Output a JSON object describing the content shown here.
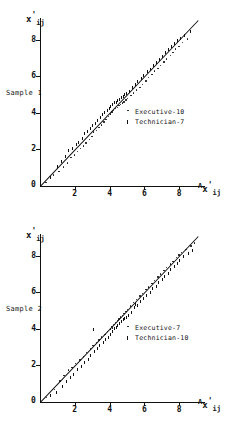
{
  "figure": {
    "background": "#ffffff",
    "ink": "#111111",
    "panel_count": 2
  },
  "chart_data": [
    {
      "type": "scatter",
      "title": "",
      "panel_label": "Sample 1",
      "xlabel": "Ax'ij",
      "ylabel": "x'ij",
      "xlabel_parts": {
        "sup": "A",
        "base": "x",
        "prime": "'",
        "sub": "ij"
      },
      "ylabel_parts": {
        "base": "x",
        "prime": "'",
        "sub": "ij"
      },
      "xlim": [
        0,
        9.2
      ],
      "ylim": [
        0,
        9.2
      ],
      "xticks": [
        2,
        4,
        6,
        8
      ],
      "yticks": [
        2,
        4,
        6,
        8
      ],
      "xticklabels": [
        "2",
        "4",
        "6",
        "8"
      ],
      "yticklabels": [
        "2",
        "4",
        "6",
        "8"
      ],
      "origin_label": "0",
      "grid": false,
      "legend_position": "center-right",
      "legend": [
        {
          "marker": "dot",
          "label": "Executive-10"
        },
        {
          "marker": "tick",
          "label": "Technician-7"
        }
      ],
      "fit_line": {
        "slope": 1.0,
        "intercept": 0.0,
        "style": "solid"
      },
      "points": [
        [
          0.3,
          0.2
        ],
        [
          0.55,
          0.45
        ],
        [
          0.75,
          0.6
        ],
        [
          0.95,
          1.05
        ],
        [
          1.05,
          0.8
        ],
        [
          1.2,
          1.35
        ],
        [
          1.3,
          1.05
        ],
        [
          1.45,
          1.6
        ],
        [
          1.55,
          1.25
        ],
        [
          1.6,
          1.95
        ],
        [
          1.75,
          1.55
        ],
        [
          1.85,
          2.05
        ],
        [
          1.95,
          1.7
        ],
        [
          2.05,
          2.25
        ],
        [
          2.1,
          1.9
        ],
        [
          2.2,
          2.4
        ],
        [
          2.3,
          2.05
        ],
        [
          2.4,
          2.6
        ],
        [
          2.45,
          2.2
        ],
        [
          2.55,
          2.85
        ],
        [
          2.6,
          2.35
        ],
        [
          2.7,
          3.0
        ],
        [
          2.8,
          2.55
        ],
        [
          2.85,
          3.15
        ],
        [
          2.95,
          2.7
        ],
        [
          3.0,
          3.3
        ],
        [
          3.05,
          2.95
        ],
        [
          3.15,
          3.45
        ],
        [
          3.2,
          3.05
        ],
        [
          3.3,
          3.6
        ],
        [
          3.35,
          3.2
        ],
        [
          3.45,
          3.75
        ],
        [
          3.5,
          3.35
        ],
        [
          3.55,
          3.9
        ],
        [
          3.65,
          3.5
        ],
        [
          3.7,
          4.05
        ],
        [
          3.75,
          3.65
        ],
        [
          3.85,
          4.15
        ],
        [
          3.9,
          3.8
        ],
        [
          3.95,
          4.25
        ],
        [
          4.0,
          3.95
        ],
        [
          4.05,
          4.35
        ],
        [
          4.1,
          4.05
        ],
        [
          4.15,
          4.45
        ],
        [
          4.2,
          4.15
        ],
        [
          4.25,
          4.55
        ],
        [
          4.3,
          4.25
        ],
        [
          4.35,
          4.6
        ],
        [
          4.4,
          4.3
        ],
        [
          4.45,
          4.7
        ],
        [
          4.5,
          4.4
        ],
        [
          4.55,
          4.75
        ],
        [
          4.6,
          4.45
        ],
        [
          4.65,
          4.85
        ],
        [
          4.7,
          4.55
        ],
        [
          4.75,
          4.9
        ],
        [
          4.8,
          4.6
        ],
        [
          4.85,
          5.0
        ],
        [
          4.9,
          4.7
        ],
        [
          4.95,
          5.05
        ],
        [
          5.0,
          4.8
        ],
        [
          5.1,
          5.2
        ],
        [
          5.2,
          4.95
        ],
        [
          5.3,
          5.4
        ],
        [
          5.35,
          5.1
        ],
        [
          5.45,
          5.55
        ],
        [
          5.5,
          5.25
        ],
        [
          5.6,
          5.7
        ],
        [
          5.7,
          5.4
        ],
        [
          5.8,
          5.9
        ],
        [
          5.85,
          5.55
        ],
        [
          5.95,
          6.05
        ],
        [
          6.05,
          5.75
        ],
        [
          6.15,
          6.25
        ],
        [
          6.2,
          5.95
        ],
        [
          6.3,
          6.4
        ],
        [
          6.4,
          6.1
        ],
        [
          6.5,
          6.6
        ],
        [
          6.55,
          6.3
        ],
        [
          6.65,
          6.75
        ],
        [
          6.75,
          6.45
        ],
        [
          6.85,
          6.95
        ],
        [
          6.9,
          6.6
        ],
        [
          7.0,
          7.1
        ],
        [
          7.1,
          6.8
        ],
        [
          7.2,
          7.3
        ],
        [
          7.25,
          6.95
        ],
        [
          7.35,
          7.45
        ],
        [
          7.45,
          7.15
        ],
        [
          7.55,
          7.65
        ],
        [
          7.6,
          7.3
        ],
        [
          7.7,
          7.8
        ],
        [
          7.75,
          7.5
        ],
        [
          7.85,
          7.95
        ],
        [
          7.95,
          7.65
        ],
        [
          8.05,
          8.1
        ],
        [
          8.15,
          7.85
        ],
        [
          8.3,
          8.25
        ],
        [
          8.45,
          8.05
        ],
        [
          8.6,
          8.45
        ]
      ]
    },
    {
      "type": "scatter",
      "title": "",
      "panel_label": "Sample 2",
      "xlabel": "Ax'ij",
      "ylabel": "x'ij",
      "xlabel_parts": {
        "sup": "A",
        "base": "x",
        "prime": "'",
        "sub": "ij"
      },
      "ylabel_parts": {
        "base": "x",
        "prime": "'",
        "sub": "ij"
      },
      "xlim": [
        0,
        9.2
      ],
      "ylim": [
        0,
        9.2
      ],
      "xticks": [
        2,
        4,
        6,
        8
      ],
      "yticks": [
        2,
        4,
        6,
        8
      ],
      "xticklabels": [
        "2",
        "4",
        "6",
        "8"
      ],
      "yticklabels": [
        "2",
        "4",
        "6",
        "8"
      ],
      "origin_label": "0",
      "grid": false,
      "legend_position": "center-right",
      "legend": [
        {
          "marker": "dot",
          "label": "Executive-7"
        },
        {
          "marker": "tick",
          "label": "Technician-10"
        }
      ],
      "fit_line": {
        "slope": 1.0,
        "intercept": 0.0,
        "style": "solid"
      },
      "points": [
        [
          0.35,
          0.25
        ],
        [
          0.6,
          0.35
        ],
        [
          0.8,
          0.7
        ],
        [
          0.9,
          0.5
        ],
        [
          1.1,
          1.15
        ],
        [
          1.25,
          0.85
        ],
        [
          1.35,
          1.45
        ],
        [
          1.5,
          1.1
        ],
        [
          1.6,
          1.75
        ],
        [
          1.7,
          1.35
        ],
        [
          1.8,
          1.9
        ],
        [
          1.9,
          1.5
        ],
        [
          2.0,
          2.1
        ],
        [
          2.15,
          1.8
        ],
        [
          2.25,
          2.3
        ],
        [
          2.35,
          1.95
        ],
        [
          2.45,
          2.5
        ],
        [
          2.55,
          2.15
        ],
        [
          2.65,
          2.7
        ],
        [
          2.75,
          2.35
        ],
        [
          2.85,
          2.9
        ],
        [
          2.9,
          2.55
        ],
        [
          3.0,
          3.1
        ],
        [
          3.1,
          2.75
        ],
        [
          3.2,
          3.25
        ],
        [
          3.25,
          2.95
        ],
        [
          3.35,
          3.4
        ],
        [
          3.4,
          3.1
        ],
        [
          3.5,
          3.55
        ],
        [
          3.6,
          3.25
        ],
        [
          3.7,
          3.7
        ],
        [
          3.75,
          3.4
        ],
        [
          3.85,
          3.85
        ],
        [
          3.9,
          3.55
        ],
        [
          4.0,
          4.0
        ],
        [
          4.05,
          3.7
        ],
        [
          4.1,
          4.15
        ],
        [
          4.15,
          3.85
        ],
        [
          4.2,
          4.25
        ],
        [
          4.25,
          4.0
        ],
        [
          4.3,
          4.35
        ],
        [
          4.35,
          4.1
        ],
        [
          4.4,
          4.45
        ],
        [
          4.45,
          4.2
        ],
        [
          4.5,
          4.55
        ],
        [
          4.55,
          4.3
        ],
        [
          4.6,
          4.65
        ],
        [
          4.65,
          4.4
        ],
        [
          4.7,
          4.75
        ],
        [
          4.75,
          4.5
        ],
        [
          4.8,
          4.85
        ],
        [
          4.85,
          4.55
        ],
        [
          4.9,
          4.95
        ],
        [
          4.95,
          4.65
        ],
        [
          5.0,
          5.05
        ],
        [
          5.05,
          4.75
        ],
        [
          5.15,
          5.25
        ],
        [
          5.25,
          4.9
        ],
        [
          5.35,
          5.45
        ],
        [
          5.4,
          5.15
        ],
        [
          5.5,
          5.6
        ],
        [
          5.6,
          5.3
        ],
        [
          5.7,
          5.8
        ],
        [
          5.75,
          5.5
        ],
        [
          5.85,
          5.95
        ],
        [
          5.95,
          5.65
        ],
        [
          6.05,
          6.15
        ],
        [
          6.1,
          5.85
        ],
        [
          6.2,
          6.3
        ],
        [
          6.3,
          6.0
        ],
        [
          6.4,
          6.5
        ],
        [
          6.45,
          6.2
        ],
        [
          6.55,
          6.65
        ],
        [
          6.65,
          6.35
        ],
        [
          6.75,
          6.85
        ],
        [
          6.8,
          6.55
        ],
        [
          6.9,
          7.0
        ],
        [
          7.0,
          6.7
        ],
        [
          7.1,
          7.2
        ],
        [
          7.15,
          6.9
        ],
        [
          7.25,
          7.35
        ],
        [
          7.35,
          7.05
        ],
        [
          7.45,
          7.55
        ],
        [
          7.5,
          7.25
        ],
        [
          7.6,
          7.7
        ],
        [
          7.7,
          7.4
        ],
        [
          7.8,
          7.9
        ],
        [
          7.85,
          7.6
        ],
        [
          7.95,
          8.05
        ],
        [
          8.0,
          7.75
        ],
        [
          8.1,
          8.2
        ],
        [
          8.2,
          7.95
        ],
        [
          8.35,
          8.35
        ],
        [
          8.5,
          8.15
        ],
        [
          8.65,
          8.55
        ],
        [
          8.75,
          8.3
        ],
        [
          8.85,
          8.7
        ],
        [
          3.05,
          3.95
        ],
        [
          4.12,
          4.05
        ],
        [
          5.45,
          5.35
        ]
      ]
    }
  ]
}
